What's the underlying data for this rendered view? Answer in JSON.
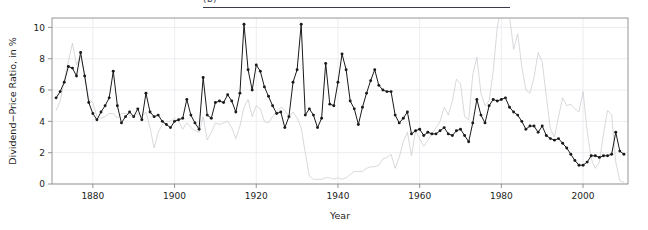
{
  "header": {
    "fragment_text": "(b)",
    "rule_color": "#3a3a4a"
  },
  "chart_data": {
    "type": "line",
    "title": "",
    "xlabel": "Year",
    "ylabel": "Dividend−Price Ratio, in %",
    "xlim": [
      1870,
      2011
    ],
    "ylim": [
      0,
      10.6
    ],
    "xticks": [
      1880,
      1900,
      1920,
      1940,
      1960,
      1980,
      2000
    ],
    "yticks": [
      0,
      2,
      4,
      6,
      8,
      10
    ],
    "grid": true,
    "grid_color": "#e8e8ef",
    "frame_color": "#8a8a8a",
    "legend_position": "none",
    "series": [
      {
        "name": "Dividend-Price Ratio",
        "color": "#1a1a1a",
        "marker": "filled-circle",
        "linewidth": 1.0,
        "x": [
          1871,
          1872,
          1873,
          1874,
          1875,
          1876,
          1877,
          1878,
          1879,
          1880,
          1881,
          1882,
          1883,
          1884,
          1885,
          1886,
          1887,
          1888,
          1889,
          1890,
          1891,
          1892,
          1893,
          1894,
          1895,
          1896,
          1897,
          1898,
          1899,
          1900,
          1901,
          1902,
          1903,
          1904,
          1905,
          1906,
          1907,
          1908,
          1909,
          1910,
          1911,
          1912,
          1913,
          1914,
          1915,
          1916,
          1917,
          1918,
          1919,
          1920,
          1921,
          1922,
          1923,
          1924,
          1925,
          1926,
          1927,
          1928,
          1929,
          1930,
          1931,
          1932,
          1933,
          1934,
          1935,
          1936,
          1937,
          1938,
          1939,
          1940,
          1941,
          1942,
          1943,
          1944,
          1945,
          1946,
          1947,
          1948,
          1949,
          1950,
          1951,
          1952,
          1953,
          1954,
          1955,
          1956,
          1957,
          1958,
          1959,
          1960,
          1961,
          1962,
          1963,
          1964,
          1965,
          1966,
          1967,
          1968,
          1969,
          1970,
          1971,
          1972,
          1973,
          1974,
          1975,
          1976,
          1977,
          1978,
          1979,
          1980,
          1981,
          1982,
          1983,
          1984,
          1985,
          1986,
          1987,
          1988,
          1989,
          1990,
          1991,
          1992,
          1993,
          1994,
          1995,
          1996,
          1997,
          1998,
          1999,
          2000,
          2001,
          2002,
          2003,
          2004,
          2005,
          2006,
          2007,
          2008,
          2009,
          2010
        ],
        "values": [
          5.5,
          5.9,
          6.5,
          7.5,
          7.4,
          6.9,
          8.4,
          6.9,
          5.2,
          4.5,
          4.1,
          4.6,
          5.0,
          5.5,
          7.2,
          5.0,
          3.9,
          4.3,
          4.6,
          4.3,
          4.8,
          4.1,
          5.8,
          4.6,
          4.3,
          4.4,
          4.0,
          3.8,
          3.6,
          4.0,
          4.1,
          4.2,
          5.4,
          4.4,
          3.9,
          3.5,
          6.8,
          4.4,
          4.2,
          5.2,
          5.3,
          5.2,
          5.7,
          5.3,
          4.6,
          5.8,
          10.2,
          7.3,
          6.0,
          7.6,
          7.2,
          6.2,
          5.6,
          5.0,
          4.5,
          4.6,
          3.6,
          4.3,
          6.5,
          7.3,
          10.2,
          4.4,
          4.8,
          4.4,
          3.6,
          4.2,
          7.7,
          5.1,
          5.0,
          6.5,
          8.3,
          7.3,
          5.3,
          4.8,
          3.8,
          4.9,
          5.8,
          6.6,
          7.3,
          6.3,
          6.0,
          5.9,
          5.9,
          4.4,
          3.9,
          4.2,
          4.6,
          3.2,
          3.4,
          3.5,
          3.1,
          3.3,
          3.2,
          3.2,
          3.4,
          3.6,
          3.2,
          3.1,
          3.4,
          3.5,
          3.1,
          2.7,
          3.9,
          5.4,
          4.4,
          3.9,
          5.0,
          5.4,
          5.3,
          5.4,
          5.5,
          4.9,
          4.6,
          4.4,
          4.0,
          3.5,
          3.7,
          3.7,
          3.3,
          3.7,
          3.1,
          2.9,
          2.8,
          2.9,
          2.6,
          2.3,
          1.9,
          1.5,
          1.2,
          1.2,
          1.4,
          1.8,
          1.8,
          1.7,
          1.8,
          1.8,
          1.9,
          3.3,
          2.1,
          1.9
        ]
      },
      {
        "name": "Comparison Series",
        "color": "#c9c9cf",
        "marker": "none",
        "linewidth": 0.7,
        "x": [
          1871,
          1872,
          1873,
          1874,
          1875,
          1876,
          1877,
          1878,
          1879,
          1880,
          1881,
          1882,
          1883,
          1884,
          1885,
          1886,
          1887,
          1888,
          1889,
          1890,
          1891,
          1892,
          1893,
          1894,
          1895,
          1896,
          1897,
          1898,
          1899,
          1900,
          1901,
          1902,
          1903,
          1904,
          1905,
          1906,
          1907,
          1908,
          1909,
          1910,
          1911,
          1912,
          1913,
          1914,
          1915,
          1916,
          1917,
          1918,
          1919,
          1920,
          1921,
          1922,
          1923,
          1924,
          1925,
          1926,
          1927,
          1928,
          1929,
          1930,
          1931,
          1932,
          1933,
          1934,
          1935,
          1936,
          1937,
          1938,
          1939,
          1940,
          1941,
          1942,
          1943,
          1944,
          1945,
          1946,
          1947,
          1948,
          1949,
          1950,
          1951,
          1952,
          1953,
          1954,
          1955,
          1956,
          1957,
          1958,
          1959,
          1960,
          1961,
          1962,
          1963,
          1964,
          1965,
          1966,
          1967,
          1968,
          1969,
          1970,
          1971,
          1972,
          1973,
          1974,
          1975,
          1976,
          1977,
          1978,
          1979,
          1980,
          1981,
          1982,
          1983,
          1984,
          1985,
          1986,
          1987,
          1988,
          1989,
          1990,
          1991,
          1992,
          1993,
          1994,
          1995,
          1996,
          1997,
          1998,
          1999,
          2000,
          2001,
          2002,
          2003,
          2004,
          2005,
          2006,
          2007,
          2008,
          2009,
          2010
        ],
        "values": [
          4.7,
          5.3,
          6.6,
          7.8,
          9.0,
          7.6,
          8.2,
          7.0,
          5.4,
          5.2,
          4.3,
          4.2,
          4.3,
          4.5,
          4.5,
          4.2,
          4.5,
          4.5,
          4.4,
          4.3,
          4.5,
          4.3,
          4.6,
          3.6,
          2.3,
          3.3,
          3.8,
          4.0,
          4.0,
          4.2,
          4.0,
          3.5,
          3.9,
          3.6,
          3.4,
          3.3,
          4.3,
          2.8,
          3.3,
          3.9,
          3.8,
          3.9,
          4.0,
          3.6,
          2.9,
          3.7,
          4.9,
          5.4,
          4.3,
          5.0,
          4.8,
          4.0,
          3.9,
          4.3,
          4.6,
          4.9,
          4.7,
          4.3,
          4.6,
          4.2,
          3.6,
          2.0,
          0.5,
          0.3,
          0.3,
          0.3,
          0.4,
          0.4,
          0.3,
          0.4,
          0.3,
          0.4,
          0.6,
          0.8,
          0.8,
          0.8,
          1.0,
          1.1,
          1.1,
          1.2,
          1.6,
          1.7,
          1.9,
          1.0,
          1.7,
          2.7,
          3.3,
          1.8,
          3.4,
          2.9,
          2.4,
          2.8,
          3.2,
          3.6,
          4.0,
          4.9,
          4.4,
          5.3,
          6.7,
          6.4,
          4.3,
          4.1,
          7.0,
          8.1,
          5.8,
          5.0,
          5.3,
          7.2,
          10.0,
          11.4,
          14.0,
          10.7,
          8.6,
          9.6,
          7.5,
          6.0,
          5.8,
          6.8,
          8.4,
          7.8,
          5.6,
          3.5,
          3.0,
          4.3,
          5.5,
          5.0,
          5.1,
          4.8,
          4.6,
          5.9,
          3.4,
          1.6,
          1.0,
          1.4,
          3.2,
          4.7,
          4.4,
          1.4,
          0.2,
          0.1
        ]
      }
    ]
  }
}
